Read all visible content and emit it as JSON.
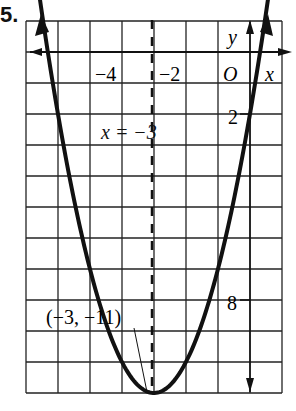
{
  "problem_number": "5.",
  "chart_data": {
    "type": "line",
    "title": "",
    "equation": "y = (x + 3)^2 - 11",
    "xlabel": "x",
    "ylabel": "y",
    "origin_label": "O",
    "xlim": [
      -7,
      1
    ],
    "ylim": [
      -11,
      1
    ],
    "grid": true,
    "x_tick_labels": [
      {
        "value": -4,
        "label": "−4"
      },
      {
        "value": -2,
        "label": "−2"
      }
    ],
    "y_tick_labels": [
      {
        "value": -2,
        "label": "−2"
      },
      {
        "value": -8,
        "label": "−8"
      }
    ],
    "axis_of_symmetry": {
      "label": "x = −3",
      "x": -3,
      "style": "dashed"
    },
    "vertex": {
      "x": -3,
      "y": -11,
      "label": "(−3, −11)"
    },
    "series": [
      {
        "name": "parabola",
        "x": [
          -6.32,
          -6,
          -5,
          -4,
          -3,
          -2,
          -1,
          0,
          0.32
        ],
        "y": [
          0,
          -2,
          -7,
          -10,
          -11,
          -10,
          -7,
          -2,
          0
        ]
      }
    ]
  },
  "labels": {
    "x_neg4": "−4",
    "x_neg2": "−2",
    "origin": "O",
    "x_axis": "x",
    "y_axis": "y",
    "y_neg2": "2",
    "y_neg8": "8",
    "sym_line": "x = −3",
    "vertex": "(−3, −11)"
  }
}
